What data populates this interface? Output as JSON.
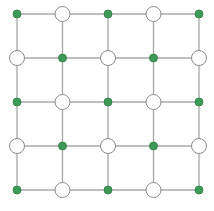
{
  "diagram": {
    "type": "grid-graph",
    "rows": 5,
    "cols": 5,
    "origin": [
      17,
      14
    ],
    "step_x": 45.5,
    "step_y": 44,
    "line_color": "#a8a8a8",
    "filled_color": "#3d9b58",
    "filled_stroke": "#2f7d45",
    "hollow_fill": "#ffffff",
    "hollow_stroke": "#8a8a8a",
    "filled_radius": 4,
    "hollow_radius": 7.5,
    "nodes": [
      [
        "filled",
        "hollow",
        "filled",
        "hollow",
        "filled"
      ],
      [
        "hollow",
        "filled",
        "hollow",
        "filled",
        "hollow"
      ],
      [
        "filled",
        "hollow",
        "filled",
        "hollow",
        "filled"
      ],
      [
        "hollow",
        "filled",
        "hollow",
        "filled",
        "hollow"
      ],
      [
        "filled",
        "hollow",
        "filled",
        "hollow",
        "filled"
      ]
    ]
  }
}
